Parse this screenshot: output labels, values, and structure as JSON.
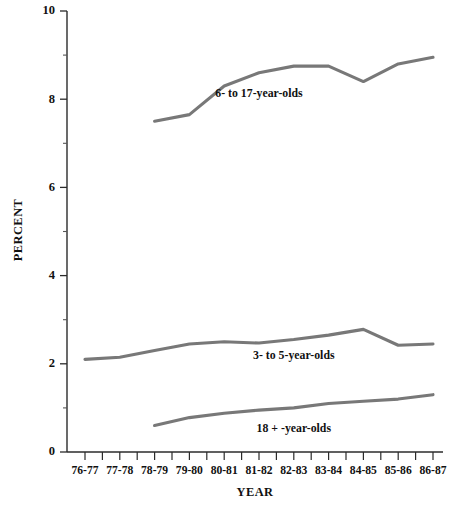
{
  "chart_data": {
    "type": "line",
    "title": "",
    "subtitle": "",
    "xlabel": "YEAR",
    "ylabel": "PERCENT",
    "categories": [
      "76-77",
      "77-78",
      "78-79",
      "79-80",
      "80-81",
      "81-82",
      "82-83",
      "83-84",
      "84-85",
      "85-86",
      "86-87"
    ],
    "ylim": [
      0,
      10
    ],
    "ytick_labels": [
      "0",
      "2",
      "4",
      "6",
      "8",
      "10"
    ],
    "ytick_values": [
      0,
      2,
      4,
      6,
      8,
      10
    ],
    "yminor_values": [
      1,
      3,
      5,
      7,
      9
    ],
    "grid": false,
    "legend_position": "inline-labels",
    "series": [
      {
        "name": "6- to 17-year-olds",
        "label": "6- to 17-year-olds",
        "color": "#787878",
        "x": [
          "78-79",
          "79-80",
          "80-81",
          "81-82",
          "82-83",
          "83-84",
          "84-85",
          "85-86",
          "86-87"
        ],
        "values": [
          7.5,
          7.65,
          8.3,
          8.6,
          8.75,
          8.75,
          8.4,
          8.8,
          8.95
        ],
        "label_x": "81-82",
        "label_value": 8.05
      },
      {
        "name": "3- to 5-year-olds",
        "label": "3- to 5-year-olds",
        "color": "#787878",
        "x": [
          "76-77",
          "77-78",
          "78-79",
          "79-80",
          "80-81",
          "81-82",
          "82-83",
          "83-84",
          "84-85",
          "85-86",
          "86-87"
        ],
        "values": [
          2.1,
          2.15,
          2.3,
          2.45,
          2.5,
          2.47,
          2.55,
          2.65,
          2.78,
          2.42,
          2.45
        ],
        "label_x": "82-83",
        "label_value": 2.12
      },
      {
        "name": "18 + -year-olds",
        "label": "18 + -year-olds",
        "color": "#787878",
        "x": [
          "78-79",
          "79-80",
          "80-81",
          "81-82",
          "82-83",
          "83-84",
          "84-85",
          "85-86",
          "86-87"
        ],
        "values": [
          0.6,
          0.78,
          0.88,
          0.95,
          1.0,
          1.1,
          1.15,
          1.2,
          1.3
        ],
        "label_x": "82-83",
        "label_value": 0.46
      }
    ]
  },
  "axes": {
    "y_title": "PERCENT",
    "x_title": "YEAR"
  },
  "colors": {
    "line": "#787878",
    "axis": "#2b2b2b",
    "text": "#111111",
    "background": "#ffffff"
  }
}
